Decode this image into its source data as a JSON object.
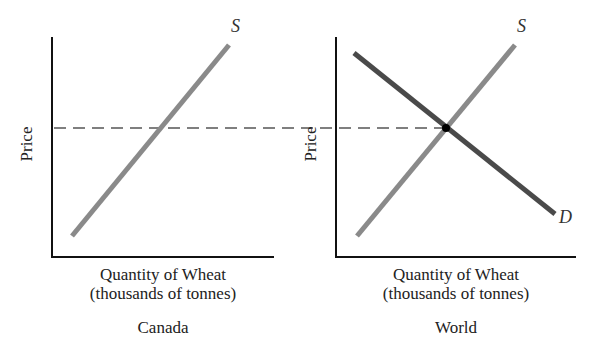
{
  "panels": [
    {
      "name": "Canada",
      "title": "Canada",
      "ylabel": "Price",
      "xlabel_line1": "Quantity of Wheat",
      "xlabel_line2": "(thousands of tonnes)",
      "curves": [
        {
          "label": "S",
          "type": "supply",
          "color": "#8a8a8a"
        }
      ]
    },
    {
      "name": "World",
      "title": "World",
      "ylabel": "Price",
      "xlabel_line1": "Quantity of Wheat",
      "xlabel_line2": "(thousands of tonnes)",
      "curves": [
        {
          "label": "S",
          "type": "supply",
          "color": "#8a8a8a"
        },
        {
          "label": "D",
          "type": "demand",
          "color": "#4a4a4a"
        }
      ],
      "equilibrium_point": true
    }
  ],
  "world_price_line": {
    "style": "dashed",
    "color": "#555555"
  },
  "colors": {
    "axis": "#111111",
    "supply": "#8a8a8a",
    "demand": "#4a4a4a",
    "dash": "#555555"
  }
}
